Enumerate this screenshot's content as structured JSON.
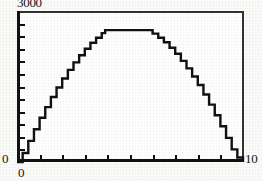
{
  "chart_data": {
    "type": "line",
    "title": "",
    "subtitle": "",
    "xlabel": "",
    "ylabel": "",
    "xlim": [
      0,
      10
    ],
    "ylim": [
      0,
      3000
    ],
    "grid": false,
    "legend": null,
    "x_tick_labels": [
      "0",
      "10"
    ],
    "y_tick_labels": [
      "0",
      "3000"
    ],
    "x_tick_count_interior": 9,
    "y_tick_count_interior": 11,
    "annotation": "curve rises from origin, flat plateau near peak, falls back to baseline at x=10",
    "series": [
      {
        "name": "curve",
        "x": [
          0.0,
          0.25,
          0.5,
          0.75,
          1.0,
          1.25,
          1.5,
          1.75,
          2.0,
          2.25,
          2.5,
          2.75,
          3.0,
          3.25,
          3.5,
          3.75,
          3.9,
          4.25,
          4.5,
          4.75,
          5.0,
          5.25,
          5.5,
          5.7,
          6.0,
          6.25,
          6.5,
          6.75,
          7.0,
          7.25,
          7.5,
          7.75,
          8.0,
          8.25,
          8.5,
          8.75,
          9.0,
          9.25,
          9.5,
          9.75,
          10.0
        ],
        "y": [
          0,
          180,
          420,
          650,
          880,
          1090,
          1290,
          1480,
          1660,
          1830,
          1980,
          2120,
          2250,
          2370,
          2470,
          2560,
          2620,
          2620,
          2620,
          2620,
          2620,
          2620,
          2620,
          2620,
          2550,
          2470,
          2380,
          2270,
          2150,
          2010,
          1860,
          1700,
          1530,
          1340,
          1140,
          930,
          710,
          480,
          250,
          90,
          0
        ]
      }
    ]
  },
  "axis": {
    "y_max_label": "3000",
    "y_min_label": "0",
    "x_min_label": "0",
    "x_max_label": "10"
  },
  "colors": {
    "curve": "#111111",
    "frame": "#1a1a1a",
    "background": "#ffffff",
    "text": "#151515"
  }
}
